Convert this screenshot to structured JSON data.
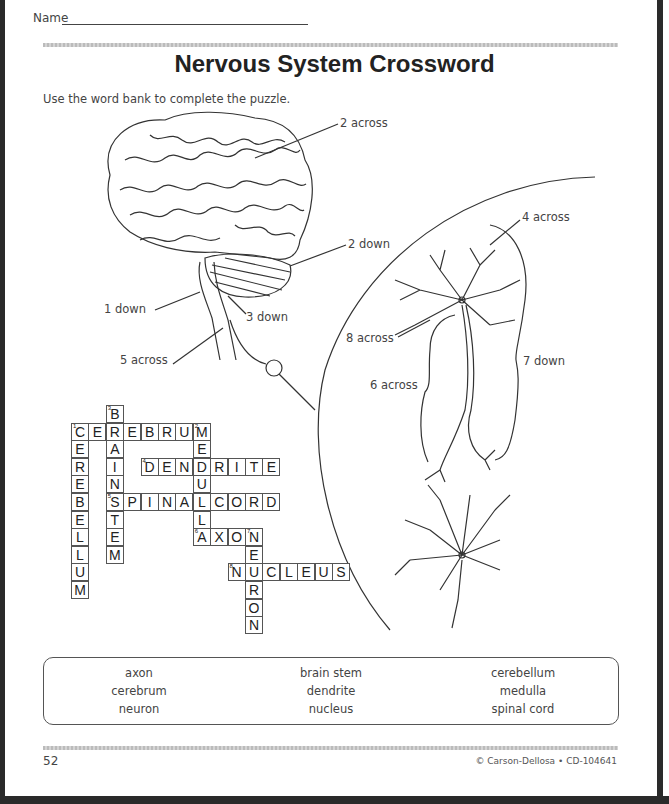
{
  "header": {
    "name_label": "Name",
    "title": "Nervous System Crossword",
    "instructions": "Use the word bank to complete the puzzle."
  },
  "diagram_labels": {
    "two_across": "2 across",
    "two_down": "2 down",
    "one_down": "1 down",
    "three_down": "3 down",
    "five_across": "5 across",
    "four_across": "4 across",
    "eight_across": "8 across",
    "six_across": "6 across",
    "seven_down": "7 down"
  },
  "crossword": {
    "clue_numbers": {
      "c1": "1",
      "c2": "2",
      "c3": "3",
      "c4": "4",
      "c5": "5",
      "c6": "6",
      "c7": "7",
      "c8": "8"
    },
    "words": [
      {
        "number": "1",
        "direction": "down",
        "answer": "CEREBELLUM",
        "row": 1,
        "col": 0
      },
      {
        "number": "2",
        "direction": "across",
        "answer": "CEREBRUM",
        "row": 1,
        "col": 0
      },
      {
        "number": "3",
        "direction": "down",
        "answer": "BRAINSTEM",
        "row": 0,
        "col": 2
      },
      {
        "number": "2",
        "direction": "down",
        "answer": "MEDULLA",
        "row": 1,
        "col": 7
      },
      {
        "number": "4",
        "direction": "across",
        "answer": "DENDRITE",
        "row": 3,
        "col": 4
      },
      {
        "number": "5",
        "direction": "across",
        "answer": "SPINALCORD",
        "row": 5,
        "col": 2
      },
      {
        "number": "6",
        "direction": "across",
        "answer": "AXON",
        "row": 7,
        "col": 7
      },
      {
        "number": "7",
        "direction": "down",
        "answer": "NEURON",
        "row": 7,
        "col": 10
      },
      {
        "number": "8",
        "direction": "across",
        "answer": "NUCLEUS",
        "row": 9,
        "col": 9
      }
    ]
  },
  "word_bank": {
    "items": [
      "axon",
      "brain stem",
      "cerebellum",
      "cerebrum",
      "dendrite",
      "medulla",
      "neuron",
      "nucleus",
      "spinal cord"
    ]
  },
  "footer": {
    "page_number": "52",
    "copyright": "© Carson-Dellosa • CD-104641"
  }
}
